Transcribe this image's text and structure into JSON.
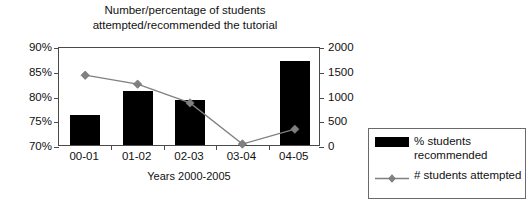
{
  "chart_data": {
    "type": "bar",
    "title": "Number/percentage of students attempted/recommended the tutorial",
    "title_line1": "Number/percentage of students",
    "title_line2": "attempted/recommended the tutorial",
    "xlabel": "Years 2000-2005",
    "ylabel": "",
    "categories": [
      "00-01",
      "01-02",
      "02-03",
      "03-04",
      "04-05"
    ],
    "grid": false,
    "legend_position": "right",
    "axes": {
      "left": {
        "ylim": [
          70,
          90
        ],
        "ticks": [
          70,
          75,
          80,
          85,
          90
        ],
        "tick_labels": [
          "70%",
          "75%",
          "80%",
          "85%",
          "90%"
        ],
        "format": "percent"
      },
      "right": {
        "ylim": [
          0,
          2000
        ],
        "ticks": [
          0,
          500,
          1000,
          1500,
          2000
        ],
        "tick_labels": [
          "0",
          "500",
          "1000",
          "1500",
          "2000"
        ],
        "format": "number"
      }
    },
    "series": [
      {
        "name": "% students recommended",
        "type": "bar",
        "axis": "left",
        "color": "#000000",
        "values": [
          76,
          81,
          79,
          70,
          87
        ]
      },
      {
        "name": "# students attempted",
        "type": "line",
        "axis": "right",
        "color": "#808080",
        "marker": "diamond",
        "values": [
          1450,
          1270,
          890,
          60,
          360
        ]
      }
    ]
  },
  "legend": {
    "items": [
      {
        "label_line1": "% students",
        "label_line2": "recommended",
        "marker": "filled-rect",
        "color": "#000000"
      },
      {
        "label_line1": "# students attempted",
        "label_line2": "",
        "marker": "line-diamond",
        "color": "#808080"
      }
    ]
  }
}
